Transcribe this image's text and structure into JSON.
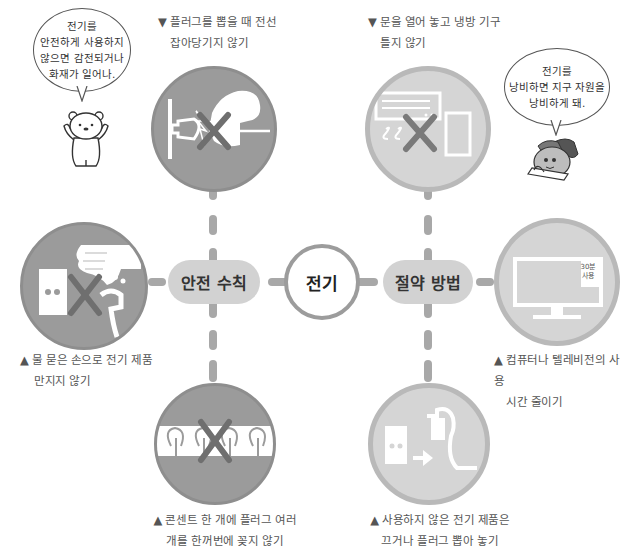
{
  "center": {
    "label": "전기"
  },
  "branches": {
    "safety": {
      "label": "안전 수칙"
    },
    "saving": {
      "label": "절약 방법"
    }
  },
  "items": {
    "safety_top": {
      "marker": "▼",
      "lines": [
        "플러그를 뽑을 때 전선",
        "잡아당기지 않기"
      ],
      "icon": "pull-plug-cord-icon",
      "prohibited": true
    },
    "safety_left": {
      "marker": "▲",
      "lines": [
        "물 묻은 손으로 전기 제품",
        "만지지 않기"
      ],
      "icon": "wet-hand-outlet-icon",
      "prohibited": true
    },
    "safety_bottom": {
      "marker": "▲",
      "lines": [
        "콘센트 한 개에 플러그 여러",
        "개를 한꺼번에 꽂지 않기"
      ],
      "icon": "multi-plug-outlet-icon",
      "prohibited": true
    },
    "saving_top": {
      "marker": "▼",
      "lines": [
        "문을 열어 놓고 냉방 기구",
        "틀지 않기"
      ],
      "icon": "air-conditioner-open-door-icon",
      "prohibited": true
    },
    "saving_right": {
      "marker": "▲",
      "lines": [
        "컴퓨터나 텔레비전의 사용",
        "시간 줄이기"
      ],
      "icon": "monitor-icon",
      "screen_label": [
        "30분",
        "사용"
      ],
      "prohibited": false
    },
    "saving_bottom": {
      "marker": "▲",
      "lines": [
        "사용하지 않은 전기 제품은",
        "끄거나 플러그 뽑아 놓기"
      ],
      "icon": "unplug-icon",
      "prohibited": false
    }
  },
  "characters": {
    "bear": {
      "icon": "bear-character-icon",
      "speech": [
        "전기를",
        "안전하게 사용하지",
        "않으면 감전되거나",
        "화재가 일어나."
      ]
    },
    "turtle": {
      "icon": "reading-character-icon",
      "speech": [
        "전기를",
        "낭비하면 지구 자원을",
        "낭비하게 돼."
      ]
    }
  },
  "colors": {
    "safety_circle": "#9b9b9b",
    "saving_circle": "#d5d5d5",
    "saving_border": "#b9b9b9",
    "connector": "#a8a8a8",
    "pill": "#d2d2d2",
    "prohibit_x": "#6f6f6f"
  }
}
